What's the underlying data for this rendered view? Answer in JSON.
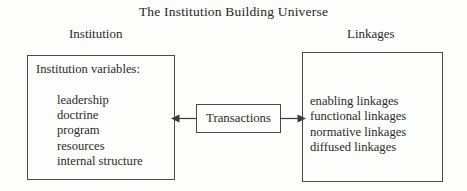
{
  "title": "The Institution Building Universe",
  "headers": {
    "left": "Institution",
    "right": "Linkages"
  },
  "institution_box": {
    "heading": "Institution variables:",
    "items": [
      "leadership",
      "doctrine",
      "program",
      "resources",
      "internal structure"
    ]
  },
  "transactions_box": {
    "label": "Transactions"
  },
  "linkages_box": {
    "items": [
      "enabling linkages",
      "functional linkages",
      "normative linkages",
      "diffused linkages"
    ]
  },
  "connectors": [
    {
      "name": "arrow-left",
      "direction": "left"
    },
    {
      "name": "arrow-right",
      "direction": "right"
    }
  ],
  "colors": {
    "background": "#fdfdfc",
    "text": "#2b2b2b",
    "border": "#4a4a4a"
  }
}
